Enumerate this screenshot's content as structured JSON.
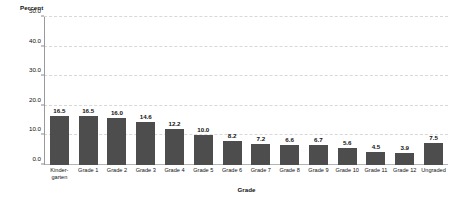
{
  "chart_data": {
    "type": "bar",
    "title": "",
    "xlabel": "Grade",
    "ylabel": "Percent",
    "ylim": [
      0,
      50
    ],
    "yticks": [
      "0.0",
      "10.0",
      "20.0",
      "30.0",
      "40.0",
      "50.0"
    ],
    "ytick_values": [
      0,
      10,
      20,
      30,
      40,
      50
    ],
    "grid": "horizontal-dashed",
    "legend": "none",
    "bar_color": "#4d4d4d",
    "categories": [
      "Kinder-\ngarten",
      "Grade 1",
      "Grade 2",
      "Grade 3",
      "Grade 4",
      "Grade 5",
      "Grade 6",
      "Grade 7",
      "Grade 8",
      "Grade 9",
      "Grade 10",
      "Grade 11",
      "Grade 12",
      "Ungraded"
    ],
    "values": [
      16.5,
      16.5,
      16.0,
      14.6,
      12.2,
      10.0,
      8.2,
      7.2,
      6.6,
      6.7,
      5.6,
      4.5,
      3.9,
      7.5
    ],
    "value_labels": [
      "16.5",
      "16.5",
      "16.0",
      "14.6",
      "12.2",
      "10.0",
      "8.2",
      "7.2",
      "6.6",
      "6.7",
      "5.6",
      "4.5",
      "3.9",
      "7.5"
    ]
  }
}
